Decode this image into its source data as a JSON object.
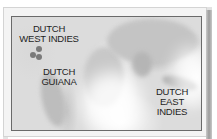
{
  "map": {
    "style": "grayscale world map, Indian/Atlantic centered",
    "colors": {
      "frame_border": "#6a6a6a",
      "label_text": "#1e1e1e",
      "marker": "#7a7a7a",
      "background": "#ffffff"
    },
    "labels": [
      {
        "id": "dutch-west-indies",
        "lines": [
          "DUTCH",
          "WEST INDIES"
        ]
      },
      {
        "id": "dutch-guiana",
        "lines": [
          "DUTCH",
          "GUIANA"
        ]
      },
      {
        "id": "dutch-east-indies",
        "lines": [
          "DUTCH",
          "EAST",
          "INDIES"
        ]
      }
    ],
    "markers": [
      {
        "id": "island-1"
      },
      {
        "id": "island-2"
      },
      {
        "id": "island-3"
      }
    ]
  }
}
